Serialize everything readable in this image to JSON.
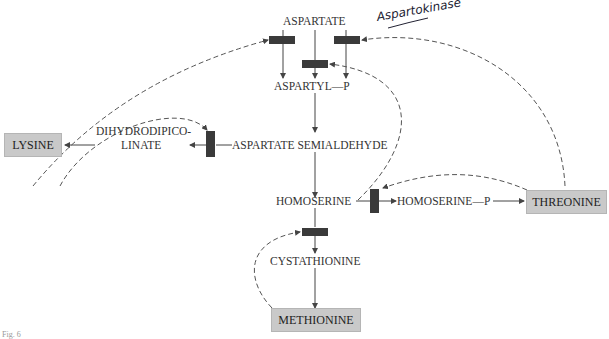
{
  "nodes": {
    "aspartate": "ASPARTATE",
    "aspartyl_p": "ASPARTYL—P",
    "aspartate_semialdehyde": "ASPARTATE SEMIALDEHYDE",
    "dihydrodipicolinate_1": "DIHYDRODIPICO-",
    "dihydrodipicolinate_2": "LINATE",
    "lysine": "LYSINE",
    "homoserine": "HOMOSERINE",
    "homoserine_p": "HOMOSERINE—P",
    "threonine": "THREONINE",
    "cystathionine": "CYSTATHIONINE",
    "methionine": "METHIONINE"
  },
  "annotation": "Aspartokinase",
  "figure_label": "Fig. 6",
  "colors": {
    "end_product_box": "#c9c9c9",
    "enzyme_block": "#3a3a3a",
    "line": "#444444"
  }
}
